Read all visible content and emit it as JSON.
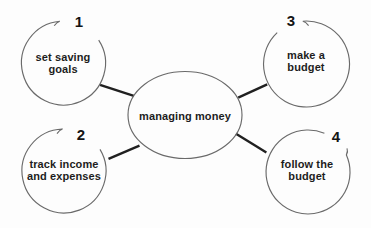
{
  "diagram": {
    "center_node": {
      "label": "managing money"
    },
    "nodes": [
      {
        "number": "1",
        "label": "set saving\ngoals"
      },
      {
        "number": "2",
        "label": "track income\nand expenses"
      },
      {
        "number": "3",
        "label": "make a\nbudget"
      },
      {
        "number": "4",
        "label": "follow the\nbudget"
      }
    ]
  },
  "colors": {
    "background": "#fdfdfd",
    "shape_outline": "#6a6a6a",
    "connector": "#202020",
    "text": "#1d1d1d"
  }
}
